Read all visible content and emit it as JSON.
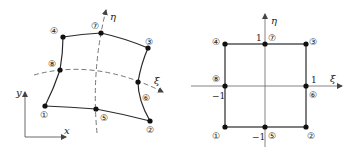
{
  "figure": {
    "left_panel": {
      "title": "Physical element (x, y)",
      "axes": {
        "x_label": "x",
        "y_label": "y",
        "xi_label": "ξ",
        "eta_label": "η"
      },
      "nodes": [
        {
          "id": "1",
          "label": "①"
        },
        {
          "id": "2",
          "label": "②"
        },
        {
          "id": "3",
          "label": "③"
        },
        {
          "id": "4",
          "label": "④"
        },
        {
          "id": "5",
          "label": "⑤"
        },
        {
          "id": "6",
          "label": "⑥"
        },
        {
          "id": "7",
          "label": "⑦"
        },
        {
          "id": "8",
          "label": "⑧"
        }
      ]
    },
    "right_panel": {
      "title": "Parent element (ξ, η)",
      "axes": {
        "xi_label": "ξ",
        "eta_label": "η"
      },
      "ticks": {
        "xi_min": "−1",
        "xi_max": "1",
        "eta_min": "−1",
        "eta_max": "1"
      },
      "nodes": [
        {
          "id": "1",
          "label": "①"
        },
        {
          "id": "2",
          "label": "②"
        },
        {
          "id": "3",
          "label": "③"
        },
        {
          "id": "4",
          "label": "④"
        },
        {
          "id": "5",
          "label": "⑤"
        },
        {
          "id": "6",
          "label": "⑥"
        },
        {
          "id": "7",
          "label": "⑦"
        },
        {
          "id": "8",
          "label": "⑧"
        }
      ]
    },
    "colors": {
      "line": "#2a2a2a",
      "axis": "#555555",
      "node": "#111111"
    }
  }
}
